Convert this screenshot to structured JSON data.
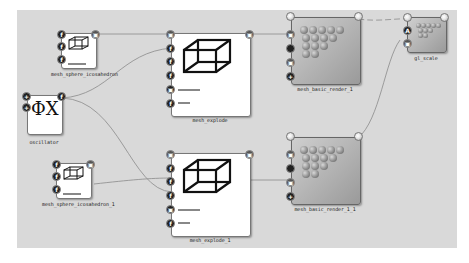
{
  "canvas": {
    "background": "#d9d9d9"
  },
  "nodes": {
    "mesh_sphere_icosahedron": {
      "label": "mesh_sphere_icosahedron",
      "icon": "wireframe-cube-icon"
    },
    "mesh_sphere_icosahedron_1": {
      "label": "mesh_sphere_icosahedron_1",
      "icon": "wireframe-cube-icon"
    },
    "oscillator": {
      "label": "oscillator",
      "icon_text": "ΦX"
    },
    "mesh_explode": {
      "label": "mesh_explode",
      "icon": "wireframe-cube-icon"
    },
    "mesh_explode_1": {
      "label": "mesh_explode_1",
      "icon": "wireframe-cube-icon"
    },
    "mesh_basic_render_1": {
      "label": "mesh_basic_render_1",
      "icon": "sphere-pyramid-icon"
    },
    "mesh_basic_render_1_1": {
      "label": "mesh_basic_render_1_1",
      "icon": "sphere-pyramid-icon"
    },
    "gl_scale": {
      "label": "gl_scale",
      "icon": "sphere-pyramid-icon"
    }
  },
  "port_glyphs": {
    "float": "f",
    "mesh": "▣",
    "add": "+",
    "axis": "A"
  },
  "colors": {
    "wire": "#8a8a8a",
    "port_dark": "#222222",
    "node_body": "#ffffff"
  }
}
